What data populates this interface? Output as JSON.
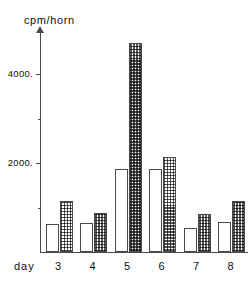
{
  "chart_data": {
    "type": "bar",
    "title": "",
    "subtitle": "",
    "xlabel": "day",
    "ylabel": "cpm/horn",
    "categories": [
      "3",
      "4",
      "5",
      "6",
      "7",
      "8"
    ],
    "ylim": [
      0,
      5000
    ],
    "xlim": [
      0,
      6
    ],
    "grid": false,
    "legend": null,
    "y_ticks": [
      {
        "value": 2000,
        "label": "2000."
      },
      {
        "value": 4000,
        "label": "4000."
      }
    ],
    "y_minor_ticks": [
      1000,
      3000
    ],
    "series": [
      {
        "name": "open",
        "fill": "white",
        "values": [
          620,
          660,
          1870,
          1870,
          530,
          680
        ]
      },
      {
        "name": "hatched",
        "fill": "checkered",
        "values": [
          1150,
          870,
          4700,
          2140,
          850,
          1150
        ]
      }
    ]
  },
  "axis": {
    "y_title": "cpm/horn",
    "x_title": "day"
  },
  "colors": {
    "axis": "#4a4a4a",
    "text": "#111111",
    "bar_outline": "#4a4a4a",
    "bar_open_fill": "#ffffff",
    "bar_hatched_ink": "#3c3c3c",
    "background": "#ffffff"
  }
}
